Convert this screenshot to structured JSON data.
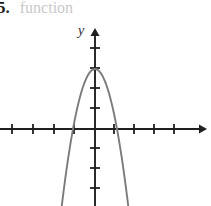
{
  "figure": {
    "width": 206,
    "height": 206,
    "background_color": "#ffffff"
  },
  "caption": {
    "problem_number": "5.",
    "text": "function",
    "text_color": "#c9c9c9",
    "number_color": "#1a1a1a"
  },
  "axes": {
    "y_axis_label": "y",
    "x_axis_label": "",
    "axis_color": "#1f1f1f",
    "origin_px": {
      "x": 95,
      "y": 129
    },
    "tick_spacing_px": 20,
    "tick_half_length_px": 5,
    "x_ticks_px": [
      12,
      33,
      54,
      74,
      114,
      134,
      154,
      174
    ],
    "y_ticks_px": [
      48,
      68,
      88,
      108,
      148,
      168,
      188
    ],
    "x_axis_arrow": "right",
    "y_axis_arrow": "up"
  },
  "chart_data": {
    "type": "line",
    "title": "",
    "subtitle": "",
    "xlabel": "",
    "ylabel": "y",
    "grid": false,
    "legend": null,
    "curve_color": "#7b7b7b",
    "curve_width_px": 1.8,
    "xlim": [
      -4.75,
      5.8
    ],
    "ylim": [
      -3.85,
      4.95
    ],
    "axis_unit_px": 20,
    "series": [
      {
        "name": "parabola",
        "type": "quadratic",
        "equation": "y = -3(x^2) + 3",
        "vertex": {
          "x": 0,
          "y": 3
        },
        "x_intercepts": [
          -1.1,
          1.1
        ],
        "y_intercept": 3,
        "opens": "down",
        "x": [
          -1.95,
          -1.6,
          -1.3,
          -1.1,
          -0.8,
          -0.5,
          -0.25,
          0,
          0.25,
          0.5,
          0.8,
          1.1,
          1.3,
          1.6,
          1.95
        ],
        "values": [
          -8.4,
          -4.7,
          -2.1,
          0,
          1.08,
          2.25,
          2.8,
          3,
          2.8,
          2.25,
          1.08,
          0,
          -2.1,
          -4.7,
          -8.4
        ]
      }
    ]
  }
}
